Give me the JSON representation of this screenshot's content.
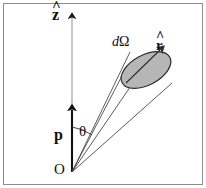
{
  "figure": {
    "background_color": "#ffffff",
    "border_color": "#8a8a8a",
    "stroke_color": "#3a3a3a",
    "axis_color": "#111111",
    "ellipse_fill": "#b6b6b6",
    "ellipse_stroke": "#2b2b2b"
  },
  "labels": {
    "z_axis": {
      "base": "z",
      "hat": "^",
      "full": "ẑ",
      "name": "z-hat"
    },
    "r_direction": {
      "base": "r",
      "hat": "^",
      "full": "r̂",
      "name": "r-hat"
    },
    "solid_angle": {
      "d": "d",
      "omega": "Ω",
      "full": "dΩ"
    },
    "polar_angle": "θ",
    "dipole_vector": "p",
    "origin": "O"
  },
  "geometry": {
    "origin_point": [
      72,
      172
    ],
    "z_axis_tip": [
      72,
      14
    ],
    "p_arrow_tip": [
      72,
      105
    ],
    "cone_axis_tip": [
      145,
      68
    ],
    "r_arrow_tip": [
      163,
      48
    ],
    "ellipse_center": [
      146,
      70
    ],
    "ellipse_rx": 27,
    "ellipse_ry": 15,
    "ellipse_rotation_deg": -28,
    "theta_arc_radius": 45
  }
}
